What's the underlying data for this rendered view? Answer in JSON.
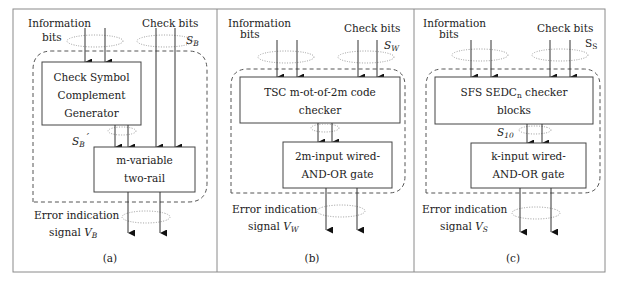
{
  "figure": {
    "panels": [
      {
        "id": "a",
        "caption": "(a)",
        "inputs_info_label_line1": "Information",
        "inputs_info_label_line2": "bits",
        "inputs_check_label": "Check bits",
        "check_bus_label": "S",
        "check_bus_sub": "B",
        "block1": {
          "line1": "Check Symbol",
          "line2": "Complement",
          "line3": "Generator"
        },
        "mid_bus_label": "S",
        "mid_bus_sub": "B",
        "mid_bus_prime": "′",
        "block2": {
          "line1": "m-variable",
          "line2": "two-rail"
        },
        "output_label_line1": "Error indication",
        "output_label_line2": "signal ",
        "output_var": "V",
        "output_sub": "B"
      },
      {
        "id": "b",
        "caption": "(b)",
        "inputs_info_label_line1": "Information",
        "inputs_info_label_line2": "bits",
        "inputs_check_label": "Check bits",
        "check_bus_label": "S",
        "check_bus_sub": "W",
        "block1": {
          "line1": "TSC m-ot-of-2m code",
          "line2": "checker"
        },
        "block2": {
          "line1": "2m-input wired-",
          "line2": "AND-OR gate"
        },
        "output_label_line1": "Error indication",
        "output_label_line2": "signal ",
        "output_var": "V",
        "output_sub": "W"
      },
      {
        "id": "c",
        "caption": "(c)",
        "inputs_info_label_line1": "Information",
        "inputs_info_label_line2": "bits",
        "inputs_check_label": "Check bits",
        "check_bus_label": "S",
        "check_bus_sub": "S",
        "block1": {
          "line1_pre": "SFS SEDC",
          "line1_sub": "n",
          "line1_post": " checker",
          "line2": "blocks"
        },
        "mid_bus_label": "S",
        "mid_bus_sub": "10",
        "block2": {
          "line1": "k-input wired-",
          "line2": "AND-OR gate"
        },
        "output_label_line1": "Error indication",
        "output_label_line2": "signal ",
        "output_var": "V",
        "output_sub": "S"
      }
    ]
  }
}
